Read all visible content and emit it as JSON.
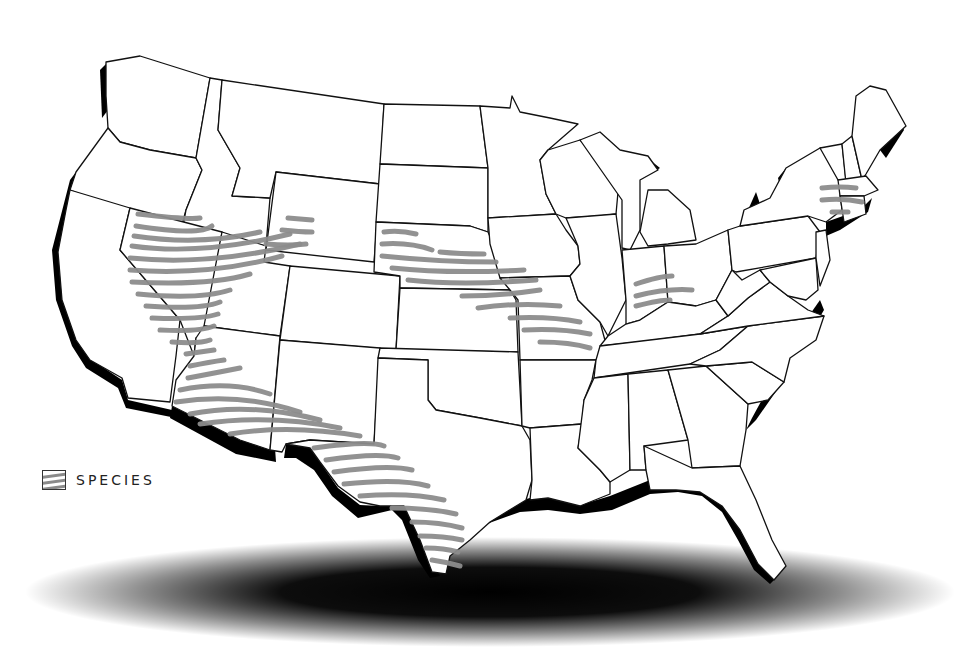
{
  "map": {
    "title": "",
    "subject": "Contiguous United States species range map",
    "background_color": "#ffffff",
    "outline_color": "#111111",
    "coast_shadow_color": "#000000",
    "range_hatch_color": "#8c8c8c"
  },
  "legend": {
    "items": [
      {
        "icon": "hatched-swatch-icon",
        "label": "SPECIES"
      }
    ]
  },
  "range_regions": [
    {
      "name": "Great Basin / Nevada-Utah",
      "states": [
        "Nevada",
        "Utah",
        "Idaho (south)",
        "Wyoming (southwest)"
      ]
    },
    {
      "name": "Southwest",
      "states": [
        "Arizona",
        "New Mexico (south)"
      ]
    },
    {
      "name": "Texas",
      "states": [
        "Texas (west/south)"
      ]
    },
    {
      "name": "Central Plains",
      "states": [
        "Nebraska",
        "Kansas (north)",
        "Iowa (southwest)",
        "Missouri"
      ]
    },
    {
      "name": "Indiana-Ohio",
      "states": [
        "Indiana",
        "Ohio (southwest)"
      ]
    },
    {
      "name": "New England",
      "states": [
        "Massachusetts",
        "Connecticut",
        "New York (east)"
      ]
    }
  ]
}
